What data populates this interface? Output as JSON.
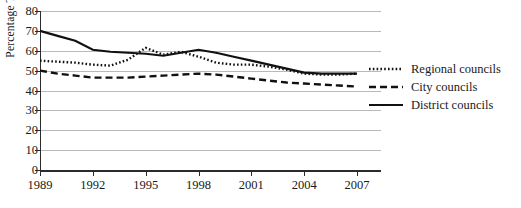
{
  "chart_data": {
    "type": "line",
    "title": "",
    "xlabel": "",
    "ylabel": "Percentage Turnout",
    "xlim": [
      1989,
      2007
    ],
    "ylim": [
      0,
      80
    ],
    "grid": true,
    "legend_position": "right",
    "x_ticks": [
      "1989",
      "1992",
      "1995",
      "1998",
      "2001",
      "2004",
      "2007"
    ],
    "y_ticks": [
      "0",
      "10",
      "20",
      "30",
      "40",
      "50",
      "60",
      "70",
      "80"
    ],
    "x": [
      1989,
      1990,
      1991,
      1992,
      1993,
      1994,
      1995,
      1996,
      1997,
      1998,
      1999,
      2000,
      2001,
      2002,
      2003,
      2004,
      2005,
      2006,
      2007
    ],
    "series": [
      {
        "name": "Regional councils",
        "style": "dotted",
        "values": [
          55,
          54.5,
          54,
          53,
          52.5,
          55.5,
          61.5,
          58,
          59.5,
          57,
          54,
          53,
          53,
          52,
          50.5,
          48.5,
          48,
          48,
          48.5
        ]
      },
      {
        "name": "City councils",
        "style": "dashed",
        "values": [
          50,
          48.5,
          47.5,
          46.5,
          46.5,
          46.5,
          47,
          47.5,
          48,
          48.5,
          48,
          47,
          46,
          45,
          44,
          43.5,
          43,
          42.5,
          42
        ]
      },
      {
        "name": "District councils",
        "style": "solid",
        "values": [
          70,
          67.5,
          65,
          60.5,
          59.5,
          59,
          58.5,
          57.5,
          59,
          60.5,
          59,
          57,
          55,
          53,
          51,
          49,
          48.5,
          48.5,
          48.5
        ]
      }
    ]
  },
  "legend": {
    "items": [
      {
        "label": "Regional councils",
        "style": "dotted"
      },
      {
        "label": "City councils",
        "style": "dashed"
      },
      {
        "label": "District councils",
        "style": "solid"
      }
    ]
  }
}
